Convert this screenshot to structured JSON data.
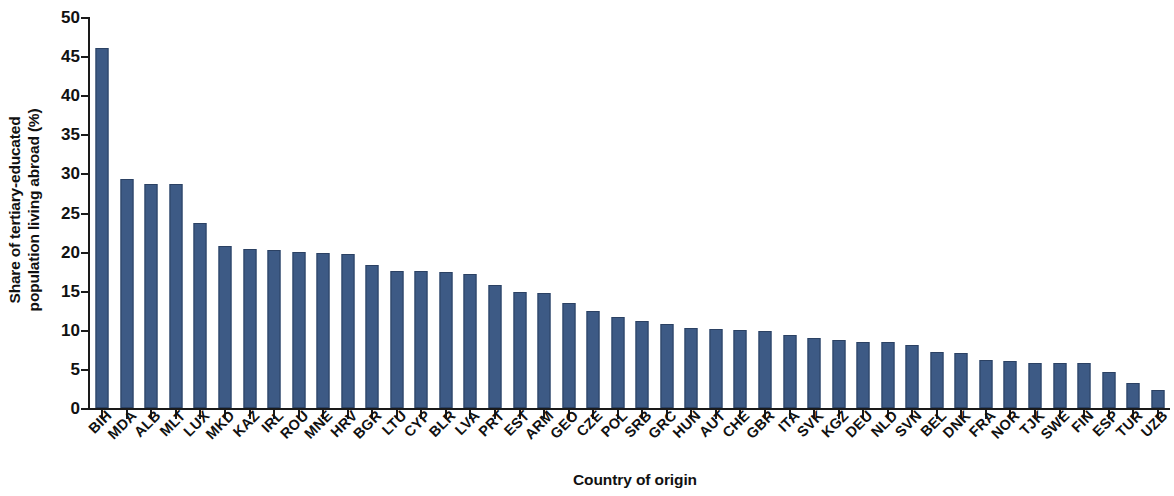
{
  "chart_data": {
    "type": "bar",
    "title": "",
    "subtitle": "",
    "xlabel": "Country of origin",
    "ylabel": "Share of tertiary-educated population living abroad (%)",
    "ylabel_line1": "Share of tertiary-educated",
    "ylabel_line2": "population living abroad (%)",
    "ylim": [
      0,
      50
    ],
    "ytick_values": [
      0,
      5,
      10,
      15,
      20,
      25,
      30,
      35,
      40,
      45,
      50
    ],
    "ytick_labels": [
      "0",
      "5",
      "10",
      "15",
      "20",
      "25",
      "30",
      "35",
      "40",
      "45",
      "50"
    ],
    "grid": false,
    "legend": false,
    "bar_color": "#3d5a85",
    "bar_edge_color": "#2b4163",
    "axis_color": "#1a1a1a",
    "categories": [
      "BIH",
      "MDA",
      "ALB",
      "MLT",
      "LUX",
      "MKD",
      "KAZ",
      "IRL",
      "ROU",
      "MNE",
      "HRV",
      "BGR",
      "LTU",
      "CYP",
      "BLR",
      "LVA",
      "PRT",
      "EST",
      "ARM",
      "GEO",
      "CZE",
      "POL",
      "SRB",
      "GRC",
      "HUN",
      "AUT",
      "CHE",
      "GBR",
      "ITA",
      "SVK",
      "KGZ",
      "DEU",
      "NLD",
      "SVN",
      "BEL",
      "DNK",
      "FRA",
      "NOR",
      "TJK",
      "SWE",
      "FIN",
      "ESP",
      "TUR",
      "UZB"
    ],
    "values": [
      46.1,
      29.3,
      28.7,
      28.6,
      23.6,
      20.7,
      20.3,
      20.2,
      20.0,
      19.8,
      19.7,
      18.3,
      17.5,
      17.5,
      17.4,
      17.2,
      15.7,
      14.8,
      14.7,
      13.4,
      12.4,
      11.6,
      11.1,
      10.8,
      10.2,
      10.1,
      10.0,
      9.8,
      9.4,
      9.0,
      8.7,
      8.5,
      8.4,
      8.1,
      7.2,
      7.0,
      6.2,
      6.0,
      5.8,
      5.8,
      5.7,
      4.6,
      3.2,
      2.3
    ]
  }
}
